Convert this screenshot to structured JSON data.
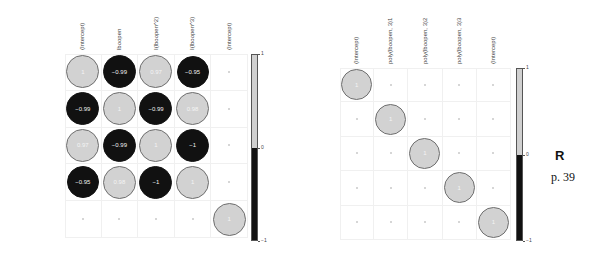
{
  "chart_data": [
    {
      "type": "heatmap",
      "subtype": "correlation-circle-plot",
      "title": "",
      "row_labels": [
        "(Intercept)",
        "lboopen",
        "I(lboopen^2)",
        "I(lboopen^3)",
        "(Intercept)"
      ],
      "col_labels": [
        "(Intercept)",
        "lboopen",
        "I(lboopen^2)",
        "I(lboopen^3)",
        "(Intercept)"
      ],
      "matrix": [
        [
          1,
          -0.99,
          0.97,
          -0.95,
          null
        ],
        [
          -0.99,
          1,
          -0.99,
          0.98,
          null
        ],
        [
          0.97,
          -0.99,
          1,
          -1,
          null
        ],
        [
          -0.95,
          0.98,
          -1,
          1,
          null
        ],
        [
          null,
          null,
          null,
          null,
          1
        ]
      ],
      "labels": [
        [
          "1",
          "−0.99",
          "0.97",
          "−0.95",
          ""
        ],
        [
          "−0.99",
          "1",
          "−0.99",
          "0.98",
          ""
        ],
        [
          "0.97",
          "−0.99",
          "1",
          "−1",
          ""
        ],
        [
          "−0.95",
          "0.98",
          "−1",
          "1",
          ""
        ],
        [
          "",
          "",
          "",
          "",
          "1"
        ]
      ],
      "colorbar": {
        "ticks": [
          "1",
          "0",
          "−1"
        ],
        "range": [
          -1,
          1
        ],
        "positive_color": "#d2d2d2",
        "negative_color": "#111111"
      }
    },
    {
      "type": "heatmap",
      "subtype": "correlation-circle-plot",
      "title": "",
      "row_labels": [
        "(Intercept)",
        "poly(lboopen, 3)1",
        "poly(lboopen, 3)2",
        "poly(lboopen, 3)3",
        "(Intercept)"
      ],
      "col_labels": [
        "(Intercept)",
        "poly(lboopen, 3)1",
        "poly(lboopen, 3)2",
        "poly(lboopen, 3)3",
        "(Intercept)"
      ],
      "matrix": [
        [
          1,
          0,
          0,
          0,
          0
        ],
        [
          0,
          1,
          0,
          0,
          0
        ],
        [
          0,
          0,
          1,
          0,
          0
        ],
        [
          0,
          0,
          0,
          1,
          0
        ],
        [
          0,
          0,
          0,
          0,
          1
        ]
      ],
      "labels": [
        [
          "1",
          "",
          "",
          "",
          ""
        ],
        [
          "",
          "1",
          "",
          "",
          ""
        ],
        [
          "",
          "",
          "1",
          "",
          ""
        ],
        [
          "",
          "",
          "",
          "1",
          ""
        ],
        [
          "",
          "",
          "",
          "",
          "1"
        ]
      ],
      "colorbar": {
        "ticks": [
          "1",
          "0",
          "−1"
        ],
        "range": [
          -1,
          1
        ],
        "positive_color": "#d2d2d2",
        "negative_color": "#111111"
      }
    }
  ],
  "side_note": {
    "letter": "R",
    "page": "p. 39"
  }
}
